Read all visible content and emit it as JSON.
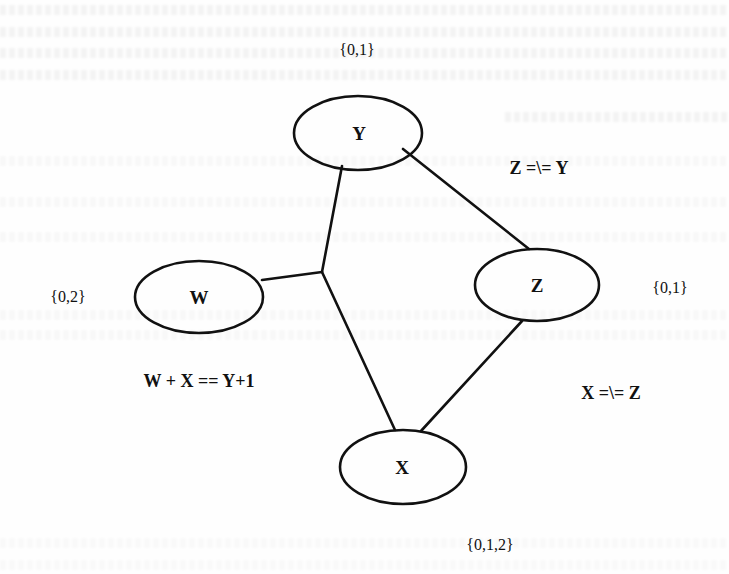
{
  "diagram": {
    "type": "constraint-graph",
    "nodes": [
      {
        "id": "Y",
        "label": "Y",
        "domain": "{0,1}"
      },
      {
        "id": "W",
        "label": "W",
        "domain": "{0,2}"
      },
      {
        "id": "Z",
        "label": "Z",
        "domain": "{0,1}"
      },
      {
        "id": "X",
        "label": "X",
        "domain": "{0,1,2}"
      }
    ],
    "constraints": [
      {
        "id": "c1",
        "label": "W + X == Y+1",
        "scope": [
          "W",
          "X",
          "Y"
        ]
      },
      {
        "id": "c2",
        "label": "Z =\\= Y",
        "scope": [
          "Z",
          "Y"
        ]
      },
      {
        "id": "c3",
        "label": "X =\\= Z",
        "scope": [
          "X",
          "Z"
        ]
      }
    ]
  },
  "colors": {
    "stroke": "#111111",
    "background": "#fefefe"
  }
}
